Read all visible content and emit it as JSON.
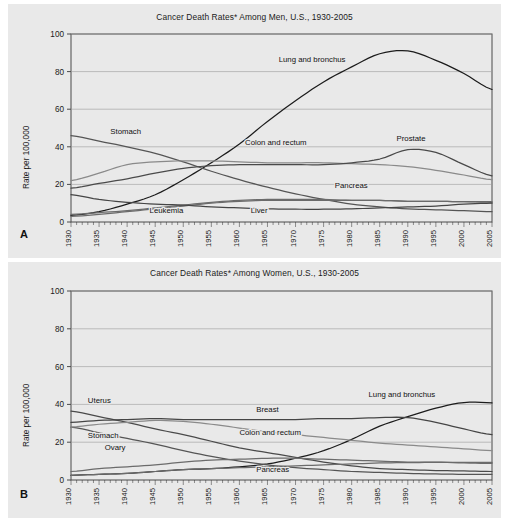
{
  "figure": {
    "background": "#ffffff",
    "panel_background": "#e9e9e9"
  },
  "panels": [
    {
      "letter": "A",
      "title": "Cancer Death Rates* Among Men, U.S., 1930-2005",
      "ylabel": "Rate per 100,000"
    },
    {
      "letter": "B",
      "title": "Cancer Death Rates* Among Women, U.S., 1930-2005",
      "ylabel": "Rate per 100,000"
    }
  ],
  "axis": {
    "yticks": [
      "0",
      "20",
      "40",
      "60",
      "80",
      "100"
    ],
    "xticks": [
      "1930",
      "1935",
      "1940",
      "1945",
      "1950",
      "1955",
      "1960",
      "1965",
      "1970",
      "1975",
      "1980",
      "1985",
      "1990",
      "1995",
      "2000",
      "2005"
    ]
  },
  "chart_data": [
    {
      "type": "line",
      "title": "Cancer Death Rates* Among Men, U.S., 1930-2005",
      "xlabel": "",
      "ylabel": "Rate per 100,000",
      "xlim": [
        1930,
        2005
      ],
      "ylim": [
        0,
        100
      ],
      "grid": true,
      "legend": "inline-annotations",
      "x": [
        1930,
        1935,
        1940,
        1945,
        1950,
        1955,
        1960,
        1965,
        1970,
        1975,
        1980,
        1985,
        1990,
        1995,
        2000,
        2005
      ],
      "series": [
        {
          "name": "Lung and bronchus",
          "color": "#1c1c1c",
          "label_xy": [
            1967,
            85
          ],
          "values": [
            3.5,
            5.5,
            9.5,
            14.5,
            22.5,
            31.5,
            41.5,
            53.5,
            64.5,
            74.5,
            82.5,
            89.5,
            91.0,
            86.0,
            79.0,
            70.5
          ]
        },
        {
          "name": "Stomach",
          "color": "#555555",
          "label_xy": [
            1937,
            47
          ],
          "values": [
            46.0,
            43.0,
            40.0,
            36.5,
            32.0,
            27.0,
            22.5,
            18.5,
            15.0,
            12.0,
            9.5,
            8.0,
            7.0,
            6.5,
            6.0,
            5.5
          ]
        },
        {
          "name": "Colon and rectum",
          "color": "#8a8a8a",
          "label_xy": [
            1961,
            41
          ],
          "values": [
            22.0,
            26.0,
            30.5,
            32.0,
            32.5,
            32.5,
            32.0,
            31.5,
            31.5,
            31.5,
            31.0,
            30.5,
            29.5,
            27.5,
            25.0,
            22.5
          ]
        },
        {
          "name": "Prostate",
          "color": "#4a4a4a",
          "label_xy": [
            1988,
            43
          ],
          "values": [
            18.0,
            20.5,
            23.0,
            26.0,
            28.5,
            30.0,
            30.5,
            30.5,
            30.5,
            30.5,
            31.5,
            33.5,
            38.5,
            37.0,
            30.5,
            24.5
          ]
        },
        {
          "name": "Pancreas",
          "color": "#6b6b6b",
          "label_xy": [
            1977,
            18
          ],
          "values": [
            3.0,
            4.0,
            5.5,
            7.0,
            8.5,
            10.0,
            11.0,
            11.5,
            11.5,
            11.5,
            11.5,
            11.5,
            11.0,
            11.0,
            10.8,
            10.8
          ]
        },
        {
          "name": "Leukemia",
          "color": "#6b6b6b",
          "label_xy": [
            1944,
            5
          ],
          "values": [
            4.0,
            5.0,
            6.0,
            7.5,
            9.0,
            10.5,
            11.5,
            12.0,
            12.0,
            12.0,
            11.5,
            11.5,
            11.0,
            11.0,
            10.8,
            10.5
          ]
        },
        {
          "name": "Liver",
          "color": "#454545",
          "label_xy": [
            1962,
            5
          ],
          "values": [
            14.5,
            12.0,
            10.5,
            9.5,
            9.0,
            8.0,
            7.5,
            7.0,
            6.8,
            6.8,
            7.0,
            7.5,
            8.0,
            8.5,
            9.5,
            10.0
          ]
        }
      ]
    },
    {
      "type": "line",
      "title": "Cancer Death Rates* Among Women, U.S., 1930-2005",
      "xlabel": "",
      "ylabel": "Rate per 100,000",
      "xlim": [
        1930,
        2005
      ],
      "ylim": [
        0,
        100
      ],
      "grid": true,
      "legend": "inline-annotations",
      "x": [
        1930,
        1935,
        1940,
        1945,
        1950,
        1955,
        1960,
        1965,
        1970,
        1975,
        1980,
        1985,
        1990,
        1995,
        2000,
        2005
      ],
      "series": [
        {
          "name": "Lung and bronchus",
          "color": "#1c1c1c",
          "label_xy": [
            1983,
            44
          ],
          "values": [
            2.5,
            3.0,
            3.5,
            4.5,
            5.5,
            6.0,
            7.0,
            8.5,
            11.5,
            15.5,
            21.5,
            28.5,
            33.5,
            38.0,
            41.0,
            40.8
          ]
        },
        {
          "name": "Uterus",
          "color": "#4a4a4a",
          "label_xy": [
            1933,
            41
          ],
          "values": [
            36.5,
            33.5,
            30.5,
            27.0,
            24.0,
            20.5,
            17.0,
            14.5,
            12.0,
            9.5,
            7.5,
            6.0,
            5.5,
            5.0,
            4.8,
            4.5
          ]
        },
        {
          "name": "Breast",
          "color": "#454545",
          "label_xy": [
            1963,
            36
          ],
          "values": [
            30.5,
            31.5,
            32.0,
            32.5,
            32.0,
            32.0,
            32.0,
            32.0,
            32.0,
            32.5,
            32.5,
            33.0,
            33.0,
            30.5,
            27.0,
            24.0
          ]
        },
        {
          "name": "Stomach",
          "color": "#555555",
          "label_xy": [
            1933,
            22
          ],
          "values": [
            28.0,
            25.0,
            22.0,
            19.0,
            15.5,
            12.5,
            10.0,
            8.0,
            6.5,
            5.5,
            4.5,
            4.0,
            3.5,
            3.2,
            3.0,
            3.0
          ]
        },
        {
          "name": "Colon and rectum",
          "color": "#8a8a8a",
          "label_xy": [
            1960,
            24
          ],
          "values": [
            28.0,
            29.5,
            30.5,
            31.5,
            31.0,
            29.5,
            27.5,
            25.5,
            24.0,
            22.5,
            21.0,
            19.5,
            18.5,
            17.5,
            16.5,
            15.5
          ]
        },
        {
          "name": "Ovary",
          "color": "#6b6b6b",
          "label_xy": [
            1936,
            16
          ],
          "values": [
            4.5,
            6.0,
            7.0,
            8.0,
            9.5,
            10.5,
            11.0,
            11.5,
            11.5,
            11.0,
            10.5,
            10.0,
            9.5,
            9.5,
            9.0,
            8.8
          ]
        },
        {
          "name": "Pancreas",
          "color": "#6b6b6b",
          "label_xy": [
            1963,
            4
          ],
          "values": [
            2.5,
            3.0,
            3.5,
            4.5,
            5.5,
            6.0,
            6.5,
            7.0,
            7.5,
            8.0,
            8.5,
            9.0,
            9.2,
            9.3,
            9.3,
            9.3
          ]
        }
      ]
    }
  ]
}
